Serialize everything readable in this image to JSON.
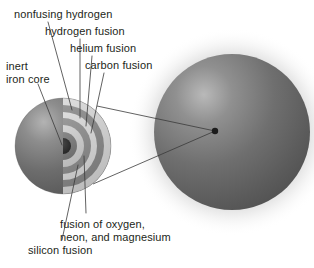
{
  "figure": {
    "type": "stellar-interior-cutaway-diagram",
    "background_color": "#ffffff",
    "text_color": "#231f20",
    "leader_line_color": "#3a3a3a"
  },
  "labels": [
    {
      "id": "nonfusing-hydrogen",
      "text": "nonfusing hydrogen",
      "x": 14,
      "y": 8
    },
    {
      "id": "hydrogen-fusion",
      "text": "hydrogen fusion",
      "x": 45,
      "y": 25
    },
    {
      "id": "helium-fusion",
      "text": "helium fusion",
      "x": 70,
      "y": 42
    },
    {
      "id": "carbon-fusion",
      "text": "carbon fusion",
      "x": 85,
      "y": 59
    },
    {
      "id": "inert-iron-core",
      "text": "inert\niron core",
      "x": 6,
      "y": 60
    },
    {
      "id": "oxygen-neon-magnesium-fusion",
      "text": "fusion of oxygen,\nneon, and magnesium",
      "x": 60,
      "y": 218
    },
    {
      "id": "silicon-fusion",
      "text": "silicon fusion",
      "x": 28,
      "y": 244
    }
  ],
  "spheres": {
    "cutaway": {
      "name": "cutaway-star-cross-section",
      "cx": 63,
      "cy": 146,
      "r": 48,
      "surface_color": "#6e6e6e"
    },
    "full": {
      "name": "full-star-sphere",
      "cx": 232,
      "cy": 132,
      "r": 78,
      "surface_color": "#6b6b6b"
    },
    "core_marker": {
      "name": "core-dot",
      "cx": 215,
      "cy": 131,
      "r": 3.2
    }
  },
  "shells": [
    {
      "id": "nonfusing-hydrogen",
      "label": "nonfusing hydrogen",
      "outer_r": 48,
      "color": "#cfcfcf"
    },
    {
      "id": "hydrogen-fusion",
      "label": "hydrogen fusion",
      "outer_r": 41,
      "color": "#8c8c8c"
    },
    {
      "id": "helium-fusion",
      "label": "helium fusion",
      "outer_r": 34,
      "color": "#d6d6d6"
    },
    {
      "id": "carbon-fusion",
      "label": "carbon fusion",
      "outer_r": 28,
      "color": "#8f8f8f"
    },
    {
      "id": "oxygen-neon-magnesium-fusion",
      "label": "fusion of oxygen, neon, and magnesium",
      "outer_r": 21,
      "color": "#c9c9c9"
    },
    {
      "id": "silicon-fusion",
      "label": "silicon fusion",
      "outer_r": 14,
      "color": "#7f7f7f"
    },
    {
      "id": "inert-iron-core",
      "label": "inert iron core",
      "outer_r": 8,
      "color": "#2e2e2e"
    }
  ],
  "leader_lines": [
    {
      "from": "nonfusing-hydrogen",
      "x1": 48,
      "y1": 22,
      "x2": 72,
      "y2": 110
    },
    {
      "from": "hydrogen-fusion",
      "x1": 80,
      "y1": 39,
      "x2": 80,
      "y2": 118
    },
    {
      "from": "helium-fusion",
      "x1": 92,
      "y1": 56,
      "x2": 86,
      "y2": 126
    },
    {
      "from": "carbon-fusion",
      "x1": 104,
      "y1": 73,
      "x2": 91,
      "y2": 133
    },
    {
      "from": "inert-iron-core",
      "x1": 38,
      "y1": 84,
      "x2": 62,
      "y2": 145
    },
    {
      "from": "oxygen-neon-magnesium-fusion",
      "x1": 86,
      "y1": 213,
      "x2": 84,
      "y2": 156
    },
    {
      "from": "silicon-fusion",
      "x1": 62,
      "y1": 240,
      "x2": 78,
      "y2": 165
    }
  ],
  "connector_lines": [
    {
      "name": "cutaway-to-core-upper",
      "x1": 97,
      "y1": 106,
      "x2": 215,
      "y2": 131
    },
    {
      "name": "cutaway-to-core-lower",
      "x1": 93,
      "y1": 184,
      "x2": 215,
      "y2": 131
    }
  ]
}
